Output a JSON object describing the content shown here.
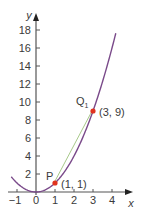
{
  "chart_data": {
    "type": "line",
    "title": "",
    "xlabel": "x",
    "ylabel": "y",
    "xlim": [
      -1.3,
      5
    ],
    "ylim": [
      0,
      19
    ],
    "x_ticks": [
      -1,
      0,
      1,
      2,
      3,
      4
    ],
    "y_ticks": [
      2,
      4,
      6,
      8,
      10,
      12,
      14,
      16,
      18
    ],
    "grid": false,
    "series": [
      {
        "name": "y = x^2",
        "kind": "curve",
        "function": "x^2",
        "x_range": [
          -1.3,
          4.2
        ],
        "color": "#7a4a8a"
      },
      {
        "name": "secant PQ1",
        "kind": "segment",
        "from": [
          1,
          1
        ],
        "to": [
          3,
          9
        ],
        "color": "#a8c98a"
      }
    ],
    "points": [
      {
        "name": "P",
        "x": 1,
        "y": 1,
        "label": "P",
        "coord_label": "(1, 1)",
        "color": "#e0321e"
      },
      {
        "name": "Q1",
        "x": 3,
        "y": 9,
        "label": "Q",
        "label_sub": "1",
        "coord_label": "(3, 9)",
        "color": "#e0321e"
      }
    ]
  },
  "layout": {
    "origin_px": [
      36,
      192
    ],
    "x_unit_px": 19,
    "y_unit_px": 9,
    "x_axis_end_px": 133,
    "x_axis_start_px": 8,
    "y_axis_top_px": 13,
    "axis_color": "#555555"
  }
}
